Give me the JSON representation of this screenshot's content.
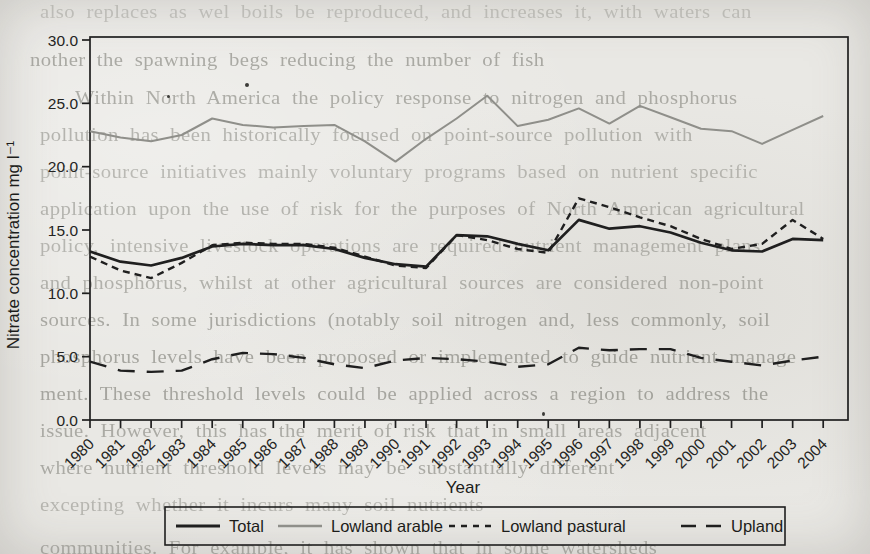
{
  "page": {
    "paper_color": "#e9e8e4",
    "ink_color": "#1f1f1f"
  },
  "chart_data": {
    "type": "line",
    "title": "",
    "xlabel": "Year",
    "ylabel": "Nitrate concentration mg l⁻¹",
    "x_range": [
      1980,
      2004
    ],
    "ylim": [
      0,
      30
    ],
    "ytick_step": 5,
    "ytick_labels": [
      "0.0",
      "5.0",
      "10.0",
      "15.0",
      "20.0",
      "25.0",
      "30.0"
    ],
    "grid": false,
    "legend_position": "bottom",
    "years": [
      1980,
      1981,
      1982,
      1983,
      1984,
      1985,
      1986,
      1987,
      1988,
      1989,
      1990,
      1991,
      1992,
      1993,
      1994,
      1995,
      1996,
      1997,
      1998,
      1999,
      2000,
      2001,
      2002,
      2003,
      2004
    ],
    "series": [
      {
        "name": "Total",
        "color": "#1f1f1f",
        "width": 2.7,
        "dash": "",
        "legend_dash": "",
        "values": [
          13.3,
          12.5,
          12.2,
          12.8,
          13.7,
          13.9,
          13.8,
          13.8,
          13.5,
          12.8,
          12.3,
          12.1,
          14.6,
          14.5,
          13.9,
          13.4,
          15.8,
          15.1,
          15.3,
          14.8,
          14.0,
          13.4,
          13.3,
          14.3,
          14.2
        ]
      },
      {
        "name": "Lowland arable",
        "color": "#8f8f8a",
        "width": 2.0,
        "dash": "",
        "legend_dash": "",
        "values": [
          22.8,
          22.3,
          22.0,
          22.5,
          23.8,
          23.3,
          23.1,
          23.2,
          23.3,
          22.0,
          20.4,
          22.2,
          23.8,
          25.6,
          23.2,
          23.7,
          24.6,
          23.4,
          24.8,
          23.9,
          23.0,
          22.8,
          21.8,
          22.9,
          24.0
        ]
      },
      {
        "name": "Lowland pastural",
        "color": "#1f1f1f",
        "width": 2.4,
        "dash": "7 5",
        "legend_dash": "6 6",
        "values": [
          12.9,
          11.8,
          11.2,
          12.4,
          13.8,
          14.0,
          13.9,
          13.9,
          13.6,
          12.9,
          12.2,
          12.0,
          14.6,
          14.2,
          13.5,
          13.2,
          17.5,
          16.8,
          16.0,
          15.3,
          14.3,
          13.5,
          13.9,
          15.8,
          14.3
        ]
      },
      {
        "name": "Upland",
        "color": "#1f1f1f",
        "width": 2.4,
        "dash": "17 12",
        "legend_dash": "15 10",
        "values": [
          4.6,
          3.9,
          3.8,
          3.9,
          4.8,
          5.3,
          5.2,
          4.9,
          4.4,
          4.1,
          4.7,
          4.9,
          4.8,
          4.6,
          4.2,
          4.4,
          5.7,
          5.5,
          5.6,
          5.6,
          4.9,
          4.6,
          4.3,
          4.7,
          5.0
        ]
      }
    ]
  },
  "background_text": {
    "lines": [
      {
        "x": 40,
        "y": 2,
        "opacity": 0.3,
        "text": "also replaces as wel boils be reproduced, and increases it, with waters can"
      },
      {
        "x": 30,
        "y": 50,
        "opacity": 0.52,
        "text": "nother the spawning begs reducing the number of fish"
      },
      {
        "x": 75,
        "y": 88,
        "opacity": 0.5,
        "text": "Within North America the policy response to nitrogen and phosphorus"
      },
      {
        "x": 40,
        "y": 125,
        "opacity": 0.44,
        "text": "pollution has been historically focused on point-source pollution with"
      },
      {
        "x": 40,
        "y": 162,
        "opacity": 0.4,
        "text": "point-source initiatives mainly voluntary programs based on nutrient specific"
      },
      {
        "x": 40,
        "y": 199,
        "opacity": 0.44,
        "text": "application upon the use of risk for the purposes of North American agricultural"
      },
      {
        "x": 40,
        "y": 236,
        "opacity": 0.42,
        "text": "policy, intensive livestock operations are required nutrient management plans"
      },
      {
        "x": 40,
        "y": 273,
        "opacity": 0.46,
        "text": "and phosphorus, whilst at other agricultural sources are considered non-point"
      },
      {
        "x": 40,
        "y": 310,
        "opacity": 0.52,
        "text": "sources. In some jurisdictions (notably soil nitrogen and, less commonly, soil"
      },
      {
        "x": 40,
        "y": 347,
        "opacity": 0.54,
        "text": "phosphorus levels have been proposed or implemented to guide nutrient manage"
      },
      {
        "x": 40,
        "y": 384,
        "opacity": 0.54,
        "text": "ment. These threshold levels could be applied across a region to address the"
      },
      {
        "x": 40,
        "y": 421,
        "opacity": 0.5,
        "text": "issue. However, this has the merit of risk that in small areas adjacent"
      },
      {
        "x": 40,
        "y": 458,
        "opacity": 0.5,
        "text": "where nutrient threshold levels may be substantially different"
      },
      {
        "x": 40,
        "y": 495,
        "opacity": 0.4,
        "text": "excepting whether it incurs many soil nutrients"
      },
      {
        "x": 40,
        "y": 538,
        "opacity": 0.48,
        "text": "communities. For example, it has shown that in some watersheds"
      }
    ]
  }
}
